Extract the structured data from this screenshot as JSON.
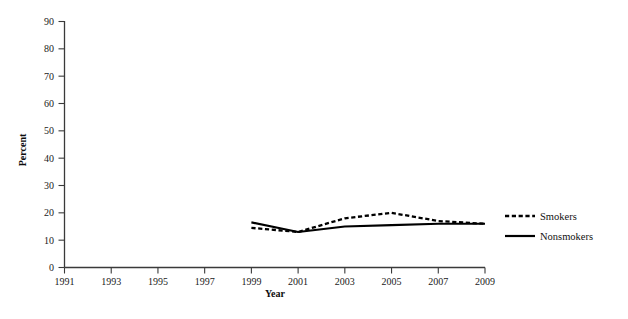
{
  "chart_data": {
    "type": "line",
    "title": "",
    "xlabel": "Year",
    "ylabel": "Percent",
    "xlim": [
      1991,
      2009
    ],
    "ylim": [
      0,
      90
    ],
    "xticks": [
      1991,
      1993,
      1995,
      1997,
      1999,
      2001,
      2003,
      2005,
      2007,
      2009
    ],
    "yticks": [
      0,
      10,
      20,
      30,
      40,
      50,
      60,
      70,
      80,
      90
    ],
    "grid": false,
    "legend_position": "right",
    "x": [
      1999,
      2001,
      2003,
      2005,
      2007,
      2009
    ],
    "series": [
      {
        "name": "Smokers",
        "style": "dashed",
        "color": "#000000",
        "values": [
          14.5,
          13,
          18,
          20,
          17,
          16
        ]
      },
      {
        "name": "Nonsmokers",
        "style": "solid",
        "color": "#000000",
        "values": [
          16.5,
          13,
          15,
          15.5,
          16,
          16
        ]
      }
    ]
  },
  "axis": {
    "y_title": "Percent",
    "x_title": "Year",
    "y_tick_labels": [
      "0",
      "10",
      "20",
      "30",
      "40",
      "50",
      "60",
      "70",
      "80",
      "90"
    ],
    "x_tick_labels": [
      "1991",
      "1993",
      "1995",
      "1997",
      "1999",
      "2001",
      "2003",
      "2005",
      "2007",
      "2009"
    ]
  },
  "legend": {
    "items": [
      {
        "label": "Smokers",
        "style": "dashed"
      },
      {
        "label": "Nonsmokers",
        "style": "solid"
      }
    ]
  }
}
